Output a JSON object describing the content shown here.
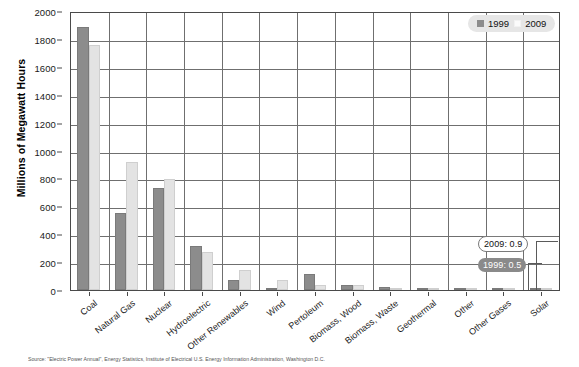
{
  "chart_data": {
    "type": "bar",
    "title": "",
    "xlabel": "",
    "ylabel": "Millions of Megawatt Hours",
    "ylim": [
      0,
      2000
    ],
    "ytick_step": 200,
    "yticks": [
      2000,
      1800,
      1600,
      1400,
      1200,
      1000,
      800,
      600,
      400,
      200,
      0
    ],
    "grid": true,
    "legend_position": "top-right",
    "categories": [
      "Coal",
      "Natural Gas",
      "Nuclear",
      "Hydroelectric",
      "Other Renewables",
      "Wind",
      "Pertoleum",
      "Biomass, Wood",
      "Biomass, Waste",
      "Geothermal",
      "Other",
      "Other Gases",
      "Solar"
    ],
    "series": [
      {
        "name": "1999",
        "color": "#8c8c8c",
        "values": [
          1884,
          551,
          728,
          319,
          75,
          4.5,
          118,
          37,
          22,
          14,
          3.5,
          1.5,
          0.5
        ]
      },
      {
        "name": "2009",
        "color": "#e3e3e3",
        "values": [
          1756,
          921,
          799,
          273,
          142,
          71,
          39,
          37,
          18,
          15,
          2.5,
          1.2,
          0.9
        ]
      }
    ],
    "annotations": [
      {
        "id": "callout-2009",
        "label": "2009: 0.9",
        "series": "2009",
        "category": "Solar",
        "value": 0.9
      },
      {
        "id": "callout-1999",
        "label": "1999: 0.5",
        "series": "1999",
        "category": "Solar",
        "value": 0.5
      }
    ]
  },
  "legend": {
    "items": [
      {
        "label": "1999",
        "swatch": "legend-swatch-1999"
      },
      {
        "label": "2009",
        "swatch": "legend-swatch-2009"
      }
    ]
  },
  "footer": {
    "note": "Source: \"Electric Power Annual\", Energy Statistics, Institute of Electrical U.S. Energy Information Administration, Washington D.C."
  }
}
